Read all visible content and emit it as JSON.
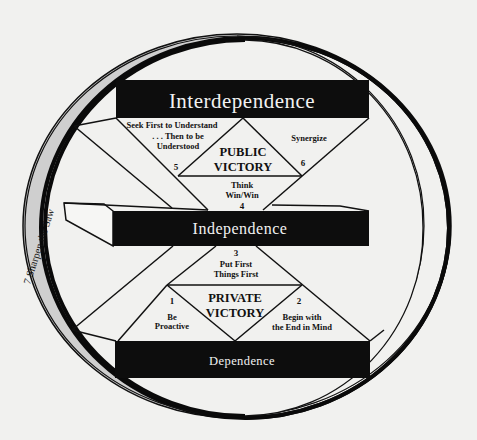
{
  "diagram": {
    "levels": {
      "interdependence": "Interdependence",
      "independence": "Independence",
      "dependence": "Dependence"
    },
    "victories": {
      "public": [
        "PUBLIC",
        "VICTORY"
      ],
      "private": [
        "PRIVATE",
        "VICTORY"
      ]
    },
    "habits": [
      {
        "number": "1",
        "lines": [
          "Be",
          "Proactive"
        ]
      },
      {
        "number": "2",
        "lines": [
          "Begin with",
          "the End in Mind"
        ]
      },
      {
        "number": "3",
        "lines": [
          "Put First",
          "Things First"
        ]
      },
      {
        "number": "4",
        "lines": [
          "Think",
          "Win/Win"
        ]
      },
      {
        "number": "5",
        "lines": [
          "Seek First to Understand",
          ". . . Then to be",
          "Understood"
        ]
      },
      {
        "number": "6",
        "lines": [
          "Synergize"
        ]
      }
    ],
    "ring_label": "7  Sharpen the Saw",
    "colors": {
      "background": "#f1f1ef",
      "bar": "#0d0d0d",
      "ring_fill": "#cfcfcf",
      "line": "#111111"
    }
  }
}
